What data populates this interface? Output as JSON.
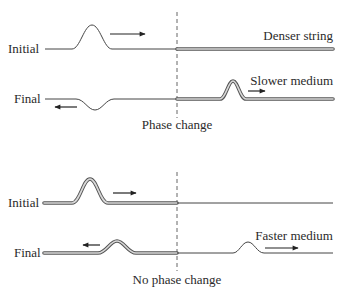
{
  "top_panel": {
    "initial_label": "Initial",
    "final_label": "Final",
    "right_medium_label": "Denser string",
    "transmitted_label": "Slower medium",
    "boundary_caption": "Phase change"
  },
  "bottom_panel": {
    "initial_label": "Initial",
    "final_label": "Final",
    "transmitted_label": "Faster medium",
    "boundary_caption": "No phase change"
  },
  "colors": {
    "ink": "#3a3a3a",
    "double_string_fill": "#d8d8d8",
    "background": "#ffffff"
  }
}
